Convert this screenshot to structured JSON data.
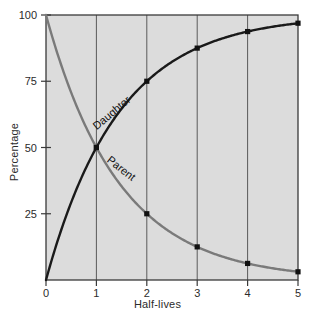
{
  "chart_data": {
    "type": "line",
    "title": "",
    "xlabel": "Half-lives",
    "ylabel": "Percentage",
    "xlim": [
      0,
      5
    ],
    "ylim": [
      0,
      100
    ],
    "xticks": [
      "0",
      "1",
      "2",
      "3",
      "4",
      "5"
    ],
    "xtick_values": [
      0,
      1,
      2,
      3,
      4,
      5
    ],
    "yticks": [
      "25",
      "50",
      "75",
      "100"
    ],
    "ytick_values": [
      25,
      50,
      75,
      100
    ],
    "grid": "vertical gridlines at each half-life",
    "legend": "inline curve labels",
    "plot_background": "#dcdcdc",
    "x": [
      0,
      1,
      2,
      3,
      4,
      5
    ],
    "series": [
      {
        "name": "Daughter",
        "label": "Daughter",
        "color": "#1a1a1a",
        "values": [
          0,
          50,
          75,
          87.5,
          93.75,
          96.9
        ],
        "markers": true
      },
      {
        "name": "Parent",
        "label": "Parent",
        "color": "#7a7a7a",
        "values": [
          100,
          50,
          25,
          12.5,
          6.25,
          3.1
        ],
        "markers": true
      }
    ],
    "annotations": [
      {
        "text": "Daughter",
        "x": 1.35,
        "y": 62,
        "rotation": -40
      },
      {
        "text": "Parent",
        "x": 1.45,
        "y": 41,
        "rotation": 38
      }
    ]
  }
}
